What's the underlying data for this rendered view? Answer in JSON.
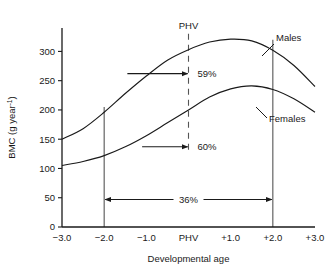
{
  "chart_data": {
    "type": "line",
    "title": "",
    "xlabel": "Developmental age",
    "ylabel": "BMC (g year",
    "ylabel_sup": "-1",
    "ylabel_tail": ")",
    "xlim": [
      -3.0,
      3.0
    ],
    "ylim": [
      0,
      340
    ],
    "grid": false,
    "legend": "inline-callout",
    "x_ticks": [
      {
        "value": -3.0,
        "label": "−3.0"
      },
      {
        "value": -2.0,
        "label": "−2.0"
      },
      {
        "value": -1.0,
        "label": "−1.0"
      },
      {
        "value": 0.0,
        "label": "PHV"
      },
      {
        "value": 1.0,
        "label": "+1.0"
      },
      {
        "value": 2.0,
        "label": "+2.0"
      },
      {
        "value": 3.0,
        "label": "+3.0"
      }
    ],
    "y_ticks": [
      {
        "value": 0,
        "label": "0"
      },
      {
        "value": 50,
        "label": "50"
      },
      {
        "value": 100,
        "label": "100"
      },
      {
        "value": 150,
        "label": "150"
      },
      {
        "value": 200,
        "label": "200"
      },
      {
        "value": 250,
        "label": "250"
      },
      {
        "value": 300,
        "label": "300"
      }
    ],
    "series": [
      {
        "name": "Males",
        "label": "Males",
        "x": [
          -3.0,
          -2.5,
          -2.0,
          -1.5,
          -1.0,
          -0.5,
          0.0,
          0.5,
          1.0,
          1.5,
          2.0,
          2.5,
          3.0
        ],
        "values": [
          150,
          168,
          196,
          228,
          258,
          285,
          303,
          316,
          321,
          318,
          302,
          276,
          240
        ]
      },
      {
        "name": "Females",
        "label": "Females",
        "x": [
          -3.0,
          -2.5,
          -2.0,
          -1.5,
          -1.0,
          -0.5,
          0.0,
          0.5,
          1.0,
          1.5,
          2.0,
          2.5,
          3.0
        ],
        "values": [
          105,
          112,
          122,
          137,
          156,
          178,
          200,
          222,
          236,
          241,
          235,
          219,
          196
        ]
      }
    ],
    "annotations": [
      {
        "name": "phv-top-label",
        "text": "PHV",
        "x": 0.0,
        "y": 338
      },
      {
        "name": "males-percent",
        "text": "59%",
        "x": 0.12,
        "y": 262,
        "arrow_from_x": -1.45,
        "arrow_to_x": -0.02,
        "arrow_y": 262
      },
      {
        "name": "females-percent",
        "text": "60%",
        "x": 0.12,
        "y": 137,
        "arrow_from_x": -1.1,
        "arrow_to_x": -0.02,
        "arrow_y": 137
      },
      {
        "name": "span-percent",
        "text": "36%",
        "x": 0.0,
        "y": 47,
        "arrow_from_x": -2.0,
        "arrow_to_x": 2.0,
        "arrow_y": 47
      }
    ],
    "reference_lines": [
      {
        "name": "line-minus-2",
        "x": -2.0,
        "style": "solid",
        "y_top": 205,
        "y_bottom": 0
      },
      {
        "name": "line-phv",
        "x": 0.0,
        "style": "dashed",
        "y_top": 330,
        "y_bottom": 130
      },
      {
        "name": "line-plus-2",
        "x": 2.0,
        "style": "solid",
        "y_top": 320,
        "y_bottom": 0
      }
    ],
    "colors": {
      "axis": "#1a1a1a",
      "curve": "#1a1a1a",
      "reference": "#4d4d4d",
      "text": "#1a1a1a",
      "background": "#ffffff"
    }
  }
}
